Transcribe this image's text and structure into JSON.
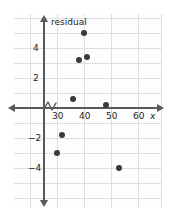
{
  "chart_data": {
    "type": "scatter",
    "title": "",
    "xlabel": "x",
    "ylabel": "residual",
    "xlim": [
      24,
      64
    ],
    "ylim": [
      -5.2,
      6.2
    ],
    "grid": true,
    "legend": null,
    "axis_break_x": true,
    "x_ticks": [
      30,
      40,
      50,
      60
    ],
    "y_ticks": [
      4,
      2,
      -2,
      -4
    ],
    "x_tick_labels": [
      "30",
      "40",
      "50",
      "60"
    ],
    "y_tick_labels": [
      "4",
      "2",
      "-2",
      "-4"
    ],
    "points": [
      {
        "x": 45,
        "y": 5.0
      },
      {
        "x": 43,
        "y": 3.2
      },
      {
        "x": 46,
        "y": 3.4
      },
      {
        "x": 41,
        "y": 0.6
      },
      {
        "x": 53,
        "y": 0.2
      },
      {
        "x": 37,
        "y": -1.8
      },
      {
        "x": 35,
        "y": -3.0
      },
      {
        "x": 58,
        "y": -4.0
      }
    ]
  },
  "labels": {
    "y_axis_title": "residual",
    "x_axis_title": "x",
    "y_4": "4",
    "y_2": "2",
    "y_neg2": "−2",
    "y_neg4": "−4",
    "x_30": "30",
    "x_40": "40",
    "x_50": "50",
    "x_60": "60"
  },
  "colors": {
    "point": "#3a3a3c",
    "axis": "#58595b",
    "grid": "#dddde2",
    "text": "#231f20",
    "background": "#ffffff"
  }
}
